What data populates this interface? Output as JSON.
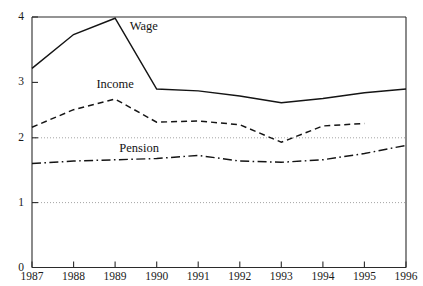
{
  "chart_data": {
    "type": "line",
    "title": "",
    "subtitle": "",
    "xlabel": "",
    "ylabel": "",
    "x": [
      1987,
      1988,
      1989,
      1990,
      1991,
      1992,
      1993,
      1994,
      1995,
      1996
    ],
    "categories": [
      "1987",
      "1988",
      "1989",
      "1990",
      "1991",
      "1992",
      "1993",
      "1994",
      "1995",
      "1996"
    ],
    "xlim": [
      1987,
      1996
    ],
    "ylim": [
      0,
      4
    ],
    "y_ticks": [
      "0",
      "1",
      "2",
      "3",
      "4"
    ],
    "y_tick_values": [
      0,
      1,
      2,
      3,
      4
    ],
    "grid": "horizontal-dotted-at-1-and-2",
    "gridline_values": [
      1,
      2
    ],
    "legend": "inline-labels",
    "series": [
      {
        "name": "Wage",
        "style": "solid",
        "x": [
          1987,
          1988,
          1989,
          1990,
          1991,
          1992,
          1993,
          1994,
          1995,
          1996
        ],
        "values": [
          3.18,
          3.72,
          3.98,
          2.85,
          2.82,
          2.74,
          2.63,
          2.7,
          2.79,
          2.85
        ]
      },
      {
        "name": "Income",
        "style": "dashed",
        "x": [
          1987,
          1988,
          1989,
          1990,
          1991,
          1992,
          1993,
          1994,
          1995
        ],
        "values": [
          2.24,
          2.52,
          2.69,
          2.32,
          2.34,
          2.28,
          2.0,
          2.26,
          2.3
        ]
      },
      {
        "name": "Pension",
        "style": "dash-dot",
        "x": [
          1987,
          1988,
          1989,
          1990,
          1991,
          1992,
          1993,
          1994,
          1995,
          1996
        ],
        "values": [
          1.66,
          1.7,
          1.72,
          1.74,
          1.79,
          1.7,
          1.68,
          1.72,
          1.82,
          1.95
        ]
      }
    ],
    "series_labels": [
      {
        "text": "Wage",
        "x": 1989.35,
        "y": 3.84
      },
      {
        "text": "Income",
        "x": 1988.55,
        "y": 2.92
      },
      {
        "text": "Pension",
        "x": 1989.1,
        "y": 1.9
      }
    ]
  }
}
